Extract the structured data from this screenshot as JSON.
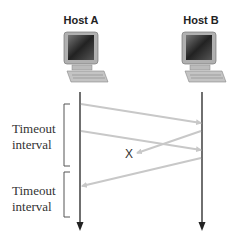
{
  "hosts": [
    {
      "label": "Host A"
    },
    {
      "label": "Host B"
    }
  ],
  "timeouts": [
    {
      "line1": "Timeout",
      "line2": "interval"
    },
    {
      "line1": "Timeout",
      "line2": "interval"
    }
  ],
  "loss_marker": "X",
  "colors": {
    "timeline": "#222222",
    "packet_arrow": "#c8c8c8",
    "bracket": "#555555"
  }
}
